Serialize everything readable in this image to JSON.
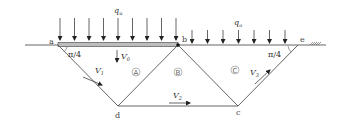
{
  "diagram": {
    "type": "bearing-capacity upper-bound failure mechanism",
    "points": {
      "a": {
        "label": "a",
        "x": 58,
        "y": 45
      },
      "b": {
        "label": "b",
        "x": 178,
        "y": 45
      },
      "e": {
        "label": "e",
        "x": 298,
        "y": 45
      },
      "d": {
        "label": "d",
        "x": 118,
        "y": 106
      },
      "c": {
        "label": "c",
        "x": 238,
        "y": 106
      }
    },
    "loads": {
      "footing": {
        "symbol": "q",
        "subscript": "u",
        "arrow_count": 9
      },
      "surcharge": {
        "symbol": "q",
        "subscript": "o",
        "arrow_count": 7
      }
    },
    "angles": [
      {
        "label": "π/4",
        "at": "a"
      },
      {
        "label": "π/4",
        "at": "e"
      }
    ],
    "blocks": [
      {
        "label": "A"
      },
      {
        "label": "B"
      },
      {
        "label": "C"
      }
    ],
    "velocities": [
      {
        "symbol": "V",
        "subscript": "0"
      },
      {
        "symbol": "V",
        "subscript": "1"
      },
      {
        "symbol": "V",
        "subscript": "2"
      },
      {
        "symbol": "V",
        "subscript": "3"
      }
    ],
    "colors": {
      "line": "#555555",
      "footing_fill": "#bdbdbd",
      "text": "#333333"
    }
  }
}
